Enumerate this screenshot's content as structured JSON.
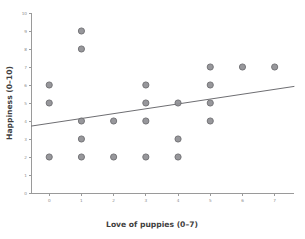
{
  "chart_data": {
    "type": "scatter",
    "title": "",
    "xlabel": "Love of puppies (0–7)",
    "ylabel": "Happiness (0–10)",
    "xlim": [
      -0.55,
      7.6
    ],
    "ylim": [
      0,
      10
    ],
    "xticks": [
      0,
      1,
      2,
      3,
      4,
      5,
      6,
      7
    ],
    "xticklabels": [
      "0",
      "1",
      "2",
      "3",
      "4",
      "5",
      "6",
      "7"
    ],
    "yticks": [
      0,
      1,
      2,
      3,
      4,
      5,
      6,
      7,
      8,
      9,
      10
    ],
    "yticklabels": [
      "0",
      "1",
      "2",
      "3",
      "4",
      "5",
      "6",
      "7",
      "8",
      "9",
      "10"
    ],
    "grid": false,
    "legend": false,
    "marker_color": "#8e8e92",
    "marker_edge_color": "#6f6f73",
    "line_color": "#6e6e72",
    "points": [
      {
        "x": 0,
        "y": 6
      },
      {
        "x": 0,
        "y": 5
      },
      {
        "x": 0,
        "y": 2
      },
      {
        "x": 1,
        "y": 9
      },
      {
        "x": 1,
        "y": 8
      },
      {
        "x": 1,
        "y": 4
      },
      {
        "x": 1,
        "y": 3
      },
      {
        "x": 1,
        "y": 2
      },
      {
        "x": 2,
        "y": 4
      },
      {
        "x": 2,
        "y": 2
      },
      {
        "x": 3,
        "y": 6
      },
      {
        "x": 3,
        "y": 5
      },
      {
        "x": 3,
        "y": 4
      },
      {
        "x": 3,
        "y": 2
      },
      {
        "x": 4,
        "y": 5
      },
      {
        "x": 4,
        "y": 3
      },
      {
        "x": 4,
        "y": 2
      },
      {
        "x": 5,
        "y": 7
      },
      {
        "x": 5,
        "y": 6
      },
      {
        "x": 5,
        "y": 5
      },
      {
        "x": 5,
        "y": 4
      },
      {
        "x": 6,
        "y": 7
      },
      {
        "x": 7,
        "y": 7
      }
    ],
    "fit_line": {
      "x_start": -0.55,
      "y_start": 3.72,
      "x_end": 7.6,
      "y_end": 5.92
    }
  }
}
